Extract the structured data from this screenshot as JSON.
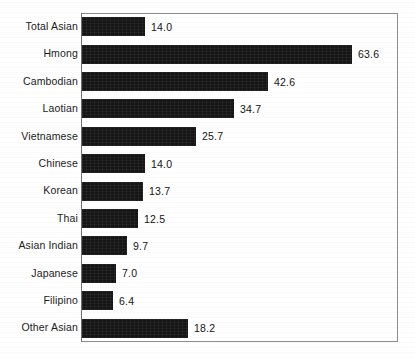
{
  "chart_data": {
    "type": "bar",
    "orientation": "horizontal",
    "title": "",
    "subtitle": "",
    "xlabel": "",
    "ylabel": "",
    "grid": false,
    "legend": null,
    "axis_frame": true,
    "value_label_format": "one-decimal",
    "xlim": [
      0,
      72
    ],
    "categories": [
      "Total Asian",
      "Hmong",
      "Cambodian",
      "Laotian",
      "Vietnamese",
      "Chinese",
      "Korean",
      "Thai",
      "Asian Indian",
      "Japanese",
      "Filipino",
      "Other Asian"
    ],
    "values": [
      14.0,
      63.6,
      42.6,
      34.7,
      25.7,
      14.0,
      13.7,
      12.5,
      9.7,
      7.0,
      6.4,
      18.2
    ],
    "value_labels": [
      "14.0",
      "63.6",
      "42.6",
      "34.7",
      "25.7",
      "14.0",
      "13.7",
      "12.5",
      "9.7",
      "7.0",
      "6.4",
      "18.2"
    ],
    "bar_pixel_widths": [
      63,
      270,
      186,
      152,
      114,
      63,
      61,
      56,
      45,
      34,
      31,
      106
    ],
    "bar_color": "#151515",
    "frame_color": "#8d8d8d",
    "text_color": "#1b1b1b",
    "background": "#ffffff"
  }
}
